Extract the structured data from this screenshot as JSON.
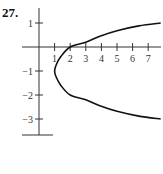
{
  "problem": {
    "number": "27."
  },
  "chart_data": {
    "type": "line",
    "title": "",
    "xlabel": "",
    "ylabel": "",
    "xlim": [
      -0.5,
      7.8
    ],
    "ylim": [
      -3.7,
      1.6
    ],
    "grid": false,
    "x_ticks": [
      1,
      2,
      3,
      4,
      5,
      6,
      7
    ],
    "x_tick_labels": [
      "1",
      "2",
      "3",
      "4",
      "5",
      "6",
      "7"
    ],
    "y_ticks": [
      1,
      -1,
      -2,
      -3
    ],
    "y_tick_labels": [
      "1",
      "−1",
      "−2",
      "−3"
    ],
    "series": [
      {
        "name": "curve",
        "description": "Sideways parabola-like curve opening right, symmetric about y = -1, vertex at (1, -1)",
        "x": [
          7.8,
          6.4,
          5.0,
          3.9,
          3.0,
          2.0,
          1.4,
          1.1,
          1.0,
          1.1,
          1.4,
          2.0,
          3.0,
          3.9,
          5.0,
          6.4,
          7.8
        ],
        "y": [
          1.0,
          0.88,
          0.68,
          0.45,
          0.2,
          0.0,
          -0.4,
          -0.75,
          -1.0,
          -1.25,
          -1.6,
          -2.0,
          -2.2,
          -2.45,
          -2.68,
          -2.88,
          -3.0
        ]
      }
    ]
  }
}
